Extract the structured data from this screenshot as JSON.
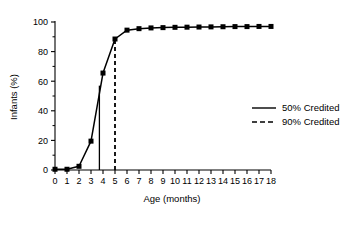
{
  "chart_data": {
    "type": "line",
    "title": "",
    "xlabel": "Age  (months)",
    "ylabel": "Infants (%)",
    "xlim": [
      0,
      18
    ],
    "ylim": [
      0,
      100
    ],
    "grid": false,
    "legend_position": "right",
    "x": [
      0,
      1,
      2,
      3,
      4,
      5,
      6,
      7,
      8,
      9,
      10,
      11,
      12,
      13,
      14,
      15,
      16,
      17,
      18
    ],
    "series": [
      {
        "name": "Cumulative infants",
        "marker": "square",
        "linestyle": "solid",
        "values": [
          0.5,
          0.5,
          2.5,
          19.5,
          65.5,
          88.5,
          94.5,
          95.5,
          96.0,
          96.2,
          96.4,
          96.5,
          96.6,
          96.7,
          96.8,
          96.9,
          96.9,
          97.0,
          97.0
        ]
      }
    ],
    "annotations": [
      {
        "name": "50% credited reference",
        "type": "vline",
        "linestyle": "solid",
        "x": 3.7,
        "y_from": 0,
        "y_to": 57
      },
      {
        "name": "90% credited reference",
        "type": "vline",
        "linestyle": "dashed",
        "x": 5.0,
        "y_from": 0,
        "y_to": 88.5
      }
    ],
    "xticks": [
      0,
      1,
      2,
      3,
      4,
      5,
      6,
      7,
      8,
      9,
      10,
      11,
      12,
      13,
      14,
      15,
      16,
      17,
      18
    ],
    "xtick_labels": [
      "0",
      "1",
      "2",
      "3",
      "4",
      "5",
      "6",
      "7",
      "8",
      "9",
      "10",
      "11",
      "12",
      "13",
      "14",
      "15",
      "16",
      "17",
      "18"
    ],
    "yticks": [
      0,
      20,
      40,
      60,
      80,
      100
    ],
    "ytick_labels": [
      "0",
      "20",
      "40",
      "60",
      "80",
      "100"
    ],
    "yticks_minor": [
      10,
      30,
      50,
      70,
      90
    ],
    "legend": [
      {
        "label": "50% Credited",
        "linestyle": "solid",
        "color": "#000000"
      },
      {
        "label": "90% Credited",
        "linestyle": "dashed",
        "color": "#000000"
      }
    ]
  },
  "colors": {
    "line": "#000000",
    "axis": "#000000",
    "background": "#ffffff"
  }
}
